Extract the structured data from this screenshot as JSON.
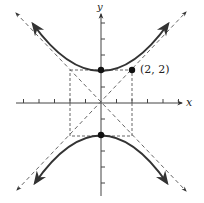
{
  "diagram": {
    "type": "hyperbola-graph",
    "axes": {
      "x_label": "x",
      "y_label": "y",
      "x_ticks": [
        -5,
        -4,
        -3,
        -2,
        -1,
        1,
        2,
        3,
        4,
        5
      ],
      "y_ticks": [
        -5,
        -4,
        -3,
        -2,
        -1,
        1,
        2,
        3,
        4,
        5
      ]
    },
    "hyperbola": {
      "vertices": [
        [
          0,
          2
        ],
        [
          0,
          -2
        ]
      ],
      "asymptotes": [
        "y = x",
        "y = -x"
      ]
    },
    "fundamental_rectangle": {
      "x": [
        -2,
        2
      ],
      "y": [
        -2,
        2
      ]
    },
    "labeled_point": {
      "coords": [
        2,
        2
      ],
      "label": "(2, 2)"
    },
    "colors": {
      "curve": "#333333",
      "axis": "#444444",
      "dashed": "#555555",
      "background": "#ffffff"
    }
  }
}
